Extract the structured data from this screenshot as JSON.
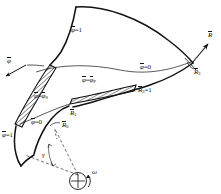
{
  "figure": {
    "type": "technical-line-diagram",
    "ink_color": "#111111",
    "background_color": "#ffffff",
    "hatch_color": "#111111"
  },
  "labels": {
    "phi_top": {
      "text": "φ=1",
      "bar_on": "φ"
    },
    "phi_vector_left": {
      "text": "φ",
      "bar_on": "φ"
    },
    "phi_s_band": {
      "text": "φ=φ",
      "sub": "S",
      "bar_on": "φ"
    },
    "phi_p_band": {
      "text": "φ=φ",
      "sub": "P",
      "bar_on": "φ"
    },
    "phi_zero_right": {
      "text": "φ=0",
      "bar_on": "φ"
    },
    "phi_zero_lower": {
      "text": "φ=0",
      "bar_on": "φ"
    },
    "phi_one_lower_left": {
      "text": "φ=1",
      "bar_on": "φ"
    },
    "r_vector": {
      "text": "R",
      "bar_on": "R"
    },
    "r3_corner": {
      "text": "R",
      "sub": "3",
      "bar_on": "R"
    },
    "r3_equals_one": {
      "text": "R",
      "sub": "3",
      "suffix": "=1",
      "bar_on": "R"
    },
    "r1_mid": {
      "text": "R",
      "sub": "1",
      "bar_on": "R"
    },
    "r0_lower": {
      "text": "R",
      "sub": "0",
      "bar_on": "R"
    },
    "gamma_angle": {
      "text": "γ"
    },
    "omega_axis": {
      "text": "ω"
    }
  },
  "geometry": {
    "curves": [
      {
        "name": "phi-1-upper-left-edge",
        "style": "solid-thick"
      },
      {
        "name": "phi-0-upper-right-edge",
        "style": "solid-thick"
      },
      {
        "name": "top-crown-curve",
        "style": "solid-thick"
      },
      {
        "name": "mid-r-curve",
        "style": "solid-thin"
      },
      {
        "name": "lower-r-curve",
        "style": "solid-thin"
      },
      {
        "name": "leading-edge-arc",
        "style": "solid-thick"
      },
      {
        "name": "hub-arc-lower-left",
        "style": "solid-thick"
      }
    ],
    "hatched_strips": [
      {
        "name": "suction-side-strip",
        "label_ref": "phi_s_band"
      },
      {
        "name": "pressure-side-strip",
        "label_ref": "phi_p_band"
      }
    ],
    "dashed_radii": [
      {
        "name": "radius-line-outer"
      },
      {
        "name": "radius-line-inner"
      }
    ],
    "rotation_axis": {
      "name": "omega-circle",
      "marker": "crosshair-circle"
    }
  }
}
